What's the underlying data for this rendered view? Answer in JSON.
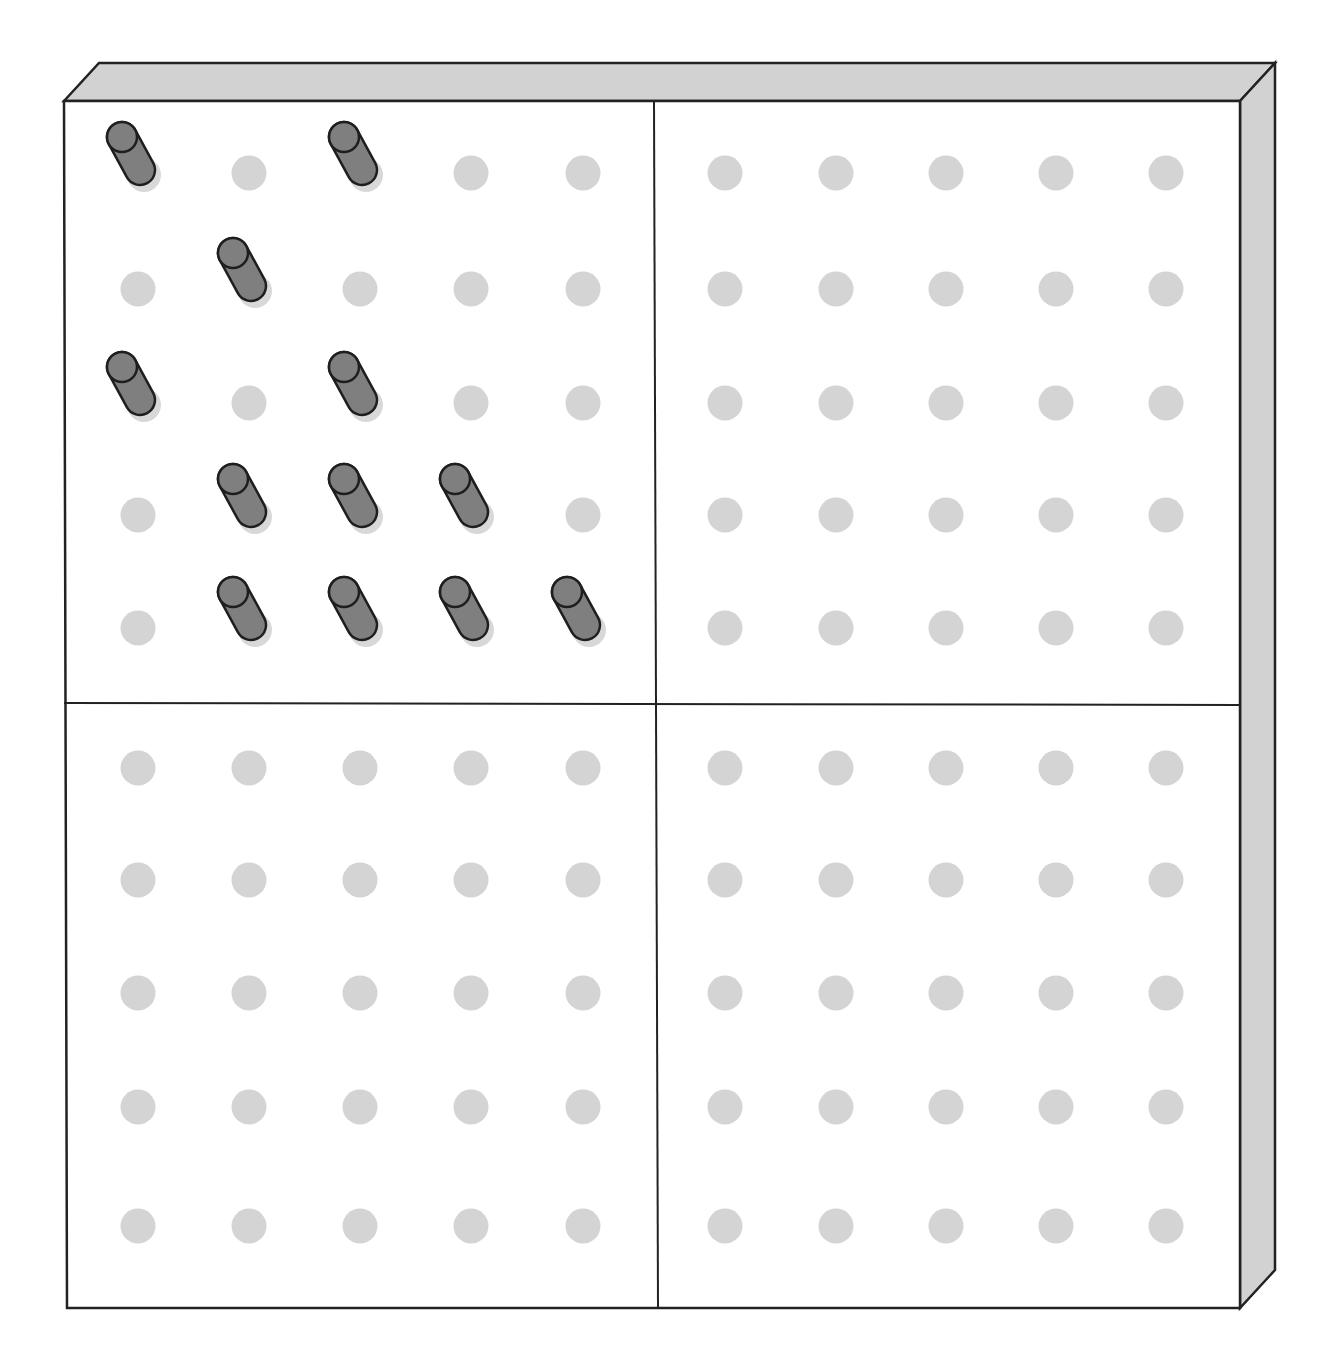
{
  "board": {
    "type": "geoboard",
    "colors": {
      "face": "#ffffff",
      "bevel": "#d2d2d2",
      "outline": "#222222",
      "hole": "#d4d4d4",
      "peg_body": "#7f7f7f",
      "peg_outline": "#1e1e1e",
      "peg_shadow": "#d8d8d8"
    },
    "quadrants": [
      {
        "name": "top-left",
        "rows": 5,
        "cols": 5
      },
      {
        "name": "top-right",
        "rows": 5,
        "cols": 5
      },
      {
        "name": "bottom-left",
        "rows": 5,
        "cols": 5
      },
      {
        "name": "bottom-right",
        "rows": 5,
        "cols": 5
      }
    ],
    "pegs_top_left": [
      [
        0,
        0
      ],
      [
        0,
        2
      ],
      [
        1,
        1
      ],
      [
        2,
        0
      ],
      [
        2,
        2
      ],
      [
        3,
        1
      ],
      [
        3,
        2
      ],
      [
        3,
        3
      ],
      [
        4,
        1
      ],
      [
        4,
        2
      ],
      [
        4,
        3
      ],
      [
        4,
        4
      ]
    ],
    "peg_count": 12,
    "grid_size": "10 x 10"
  }
}
